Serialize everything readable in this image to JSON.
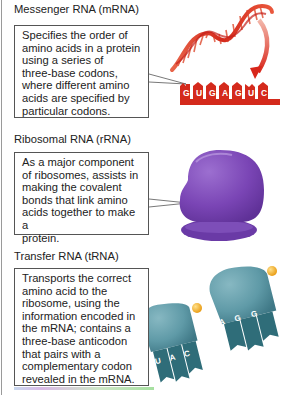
{
  "sections": [
    {
      "title": "Messenger RNA (mRNA)",
      "description_lines": [
        "Specifies the order of",
        "amino acids in a protein",
        "using a series of",
        "three-base codons,",
        "where different amino",
        "acids are specified by",
        "particular codons."
      ],
      "illustration": "mrna-helix-and-codon-strand",
      "bases": [
        "G",
        "U",
        "G",
        "A",
        "G",
        "U",
        "C"
      ],
      "color": "#d42a1c"
    },
    {
      "title": "Ribosomal RNA (rRNA)",
      "description_lines": [
        "As a major component",
        "of ribosomes, assists in",
        "making the covalent",
        "bonds that link amino",
        "acids together to make a",
        "protein."
      ],
      "illustration": "ribosome",
      "color": "#7a45b5"
    },
    {
      "title": "Transfer RNA (tRNA)",
      "description_lines": [
        "Transports the correct",
        "amino acid to the",
        "ribosome, using the",
        "information encoded in",
        "the mRNA; contains a",
        "three-base anticodon",
        "that pairs with a",
        "complementary codon",
        "revealed in the mRNA."
      ],
      "illustration": "trna-pair",
      "anticodons": [
        [
          "U",
          "A",
          "C"
        ],
        [
          "A",
          "G",
          "G"
        ]
      ],
      "color": "#4f8f9c",
      "amino_acid_color": "#f2a81c"
    }
  ]
}
